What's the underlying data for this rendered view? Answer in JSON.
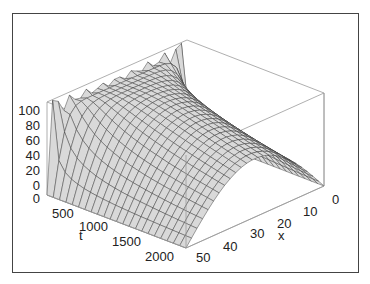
{
  "chart_data": {
    "type": "surface3d",
    "title": "",
    "xlabel": "x",
    "ylabel": "t",
    "zlabel": "",
    "x_range": [
      0,
      50
    ],
    "t_range": [
      0,
      2200
    ],
    "z_range": [
      0,
      110
    ],
    "x_ticks": [
      "0",
      "10",
      "20",
      "30",
      "40",
      "50"
    ],
    "t_ticks": [
      "0",
      "500",
      "1000",
      "1500",
      "2000"
    ],
    "z_ticks": [
      "0",
      "20",
      "40",
      "60",
      "80",
      "100"
    ],
    "grid_x_lines": 25,
    "grid_t_lines": 22,
    "surface_color": "#d9d9d9",
    "mesh_color": "#333333",
    "box_color": "#9a9a9a"
  }
}
